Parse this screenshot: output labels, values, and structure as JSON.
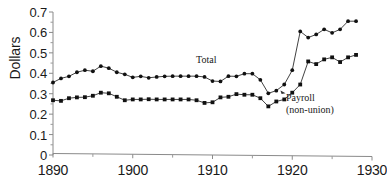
{
  "chart_data": {
    "type": "line",
    "title": "",
    "subtitle": "",
    "xlabel": "",
    "ylabel": "Dollars",
    "xlim": [
      1890,
      1930
    ],
    "ylim": [
      0,
      0.7
    ],
    "grid": false,
    "legend_position": "inline-annotation",
    "y_ticks": [
      "0",
      "0.1",
      "0.2",
      "0.3",
      "0.4",
      "0.5",
      "0.6",
      "0.7"
    ],
    "y_tick_values": [
      0,
      0.1,
      0.2,
      0.3,
      0.4,
      0.5,
      0.6,
      0.7
    ],
    "x_ticks": [
      "1890",
      "1900",
      "1910",
      "1920",
      "1930"
    ],
    "x_tick_values": [
      1890,
      1900,
      1910,
      1920,
      1930
    ],
    "x_minor_tick_values": [
      1895,
      1905,
      1915,
      1925
    ],
    "x": [
      1890,
      1891,
      1892,
      1893,
      1894,
      1895,
      1896,
      1897,
      1898,
      1899,
      1900,
      1901,
      1902,
      1903,
      1904,
      1905,
      1906,
      1907,
      1908,
      1909,
      1910,
      1911,
      1912,
      1913,
      1914,
      1915,
      1916,
      1917,
      1918,
      1919,
      1920,
      1921,
      1922,
      1923,
      1924,
      1925,
      1926,
      1927,
      1928
    ],
    "series": [
      {
        "name": "Total",
        "marker": "filled-circle",
        "color": "#111111",
        "annotation": "Total",
        "values": [
          0.355,
          0.375,
          0.385,
          0.405,
          0.415,
          0.41,
          0.435,
          0.425,
          0.405,
          0.395,
          0.38,
          0.385,
          0.378,
          0.382,
          0.385,
          0.386,
          0.386,
          0.386,
          0.386,
          0.382,
          0.362,
          0.36,
          0.386,
          0.385,
          0.398,
          0.398,
          0.368,
          0.302,
          0.315,
          0.345,
          0.415,
          0.605,
          0.575,
          0.59,
          0.615,
          0.598,
          0.615,
          0.655,
          0.655
        ]
      },
      {
        "name": "Payroll (non-union)",
        "marker": "filled-square",
        "color": "#111111",
        "annotation": "Payroll\n(non-union)",
        "annotation_line1": "Payroll",
        "annotation_line2": "(non-union)",
        "values": [
          0.268,
          0.265,
          0.278,
          0.282,
          0.283,
          0.29,
          0.305,
          0.302,
          0.285,
          0.268,
          0.272,
          0.272,
          0.273,
          0.272,
          0.272,
          0.272,
          0.272,
          0.272,
          0.268,
          0.255,
          0.258,
          0.282,
          0.285,
          0.298,
          0.295,
          0.295,
          0.278,
          0.238,
          0.262,
          0.272,
          0.305,
          0.345,
          0.458,
          0.445,
          0.468,
          0.478,
          0.455,
          0.478,
          0.49
        ]
      }
    ]
  },
  "axis_title": {
    "y": "Dollars"
  },
  "annotations": {
    "total": "Total",
    "payroll_line1": "Payroll",
    "payroll_line2": "(non-union)"
  }
}
